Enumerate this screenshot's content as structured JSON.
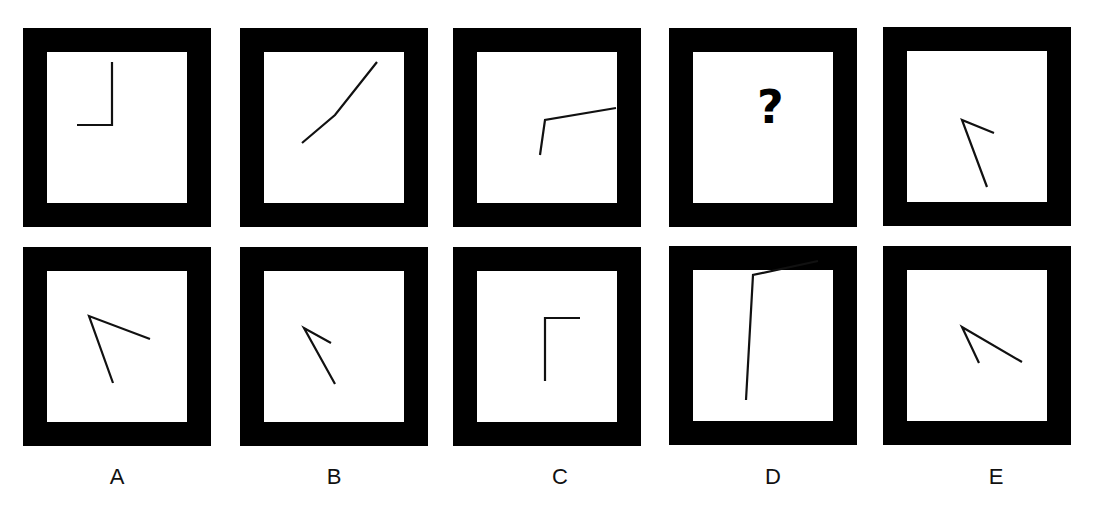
{
  "puzzle": {
    "question_row": [
      {
        "id": "q1",
        "points": [
          [
            77,
            125
          ],
          [
            112,
            125
          ],
          [
            112,
            62
          ]
        ]
      },
      {
        "id": "q2",
        "points": [
          [
            302,
            143
          ],
          [
            335,
            115
          ],
          [
            377,
            62
          ]
        ]
      },
      {
        "id": "q3",
        "points": [
          [
            540,
            155
          ],
          [
            545,
            120
          ],
          [
            616,
            108
          ]
        ]
      },
      {
        "id": "q4",
        "missing": true,
        "symbol": "?"
      },
      {
        "id": "q5",
        "points": [
          [
            987,
            187
          ],
          [
            962,
            120
          ],
          [
            994,
            133
          ]
        ]
      }
    ],
    "options": [
      {
        "label": "A",
        "points": [
          [
            113,
            383
          ],
          [
            89,
            316
          ],
          [
            150,
            339
          ]
        ]
      },
      {
        "label": "B",
        "points": [
          [
            335,
            384
          ],
          [
            304,
            328
          ],
          [
            331,
            343
          ]
        ]
      },
      {
        "label": "C",
        "points": [
          [
            545,
            381
          ],
          [
            545,
            318
          ],
          [
            580,
            318
          ]
        ]
      },
      {
        "label": "D",
        "points": [
          [
            746,
            400
          ],
          [
            753,
            275
          ],
          [
            818,
            261
          ]
        ]
      },
      {
        "label": "E",
        "points": [
          [
            979,
            363
          ],
          [
            962,
            327
          ],
          [
            1022,
            362
          ]
        ]
      }
    ],
    "colors": {
      "frame": "#000000",
      "background": "#ffffff",
      "line": "#111111"
    }
  }
}
